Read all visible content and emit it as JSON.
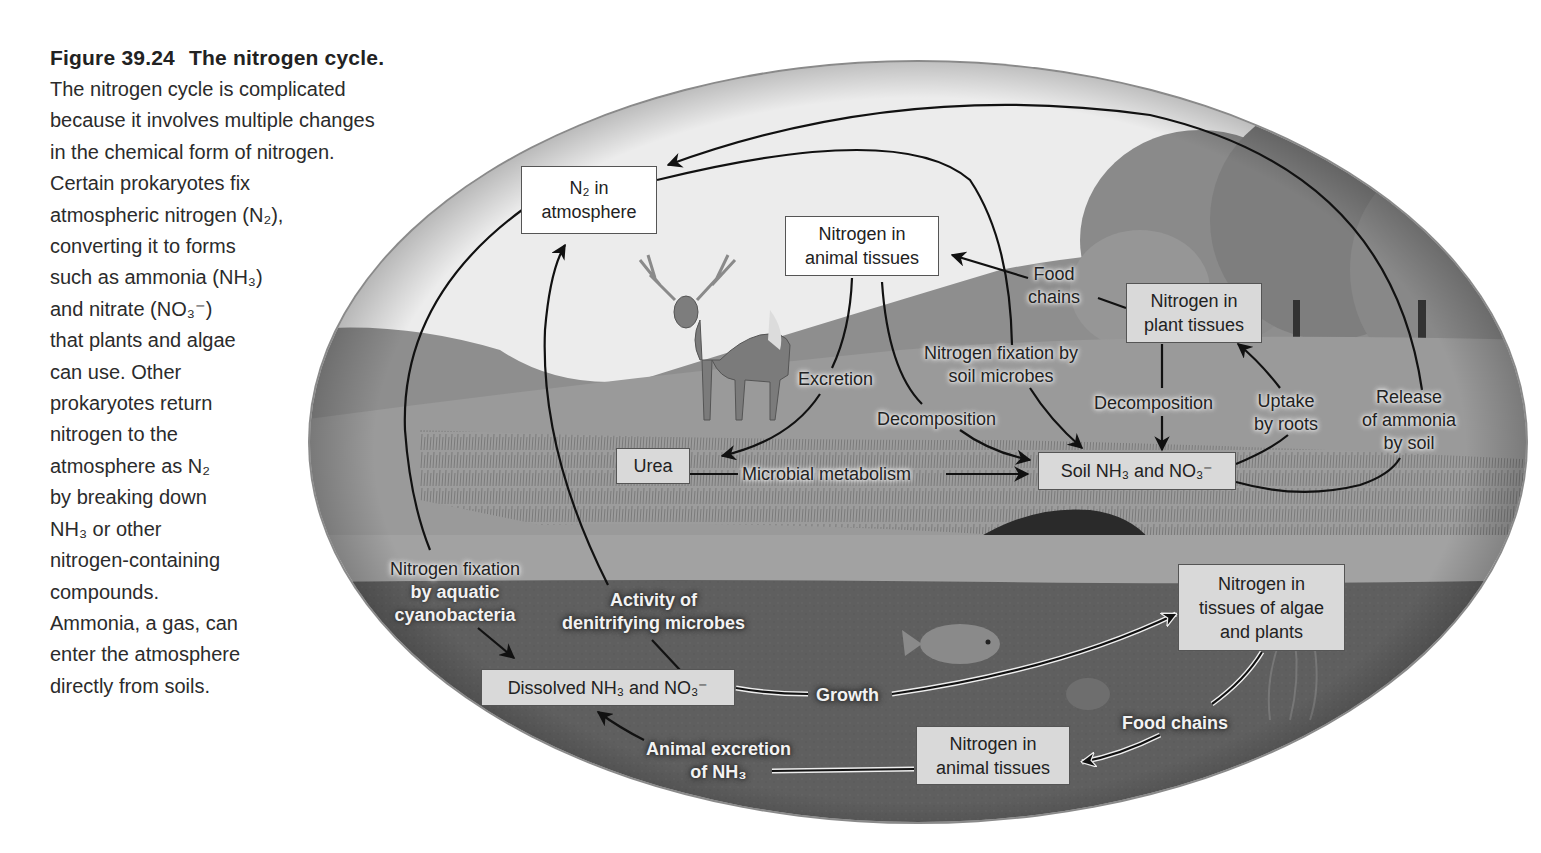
{
  "caption": {
    "figure_number": "Figure 39.24",
    "title": "The nitrogen cycle.",
    "lines": [
      "The nitrogen cycle is complicated",
      "because it involves multiple changes",
      "in the chemical form of nitrogen.",
      "Certain prokaryotes fix",
      "atmospheric nitrogen (N₂),",
      "converting it to forms",
      "such as ammonia (NH₃)",
      "and nitrate (NO₃⁻)",
      "that plants and algae",
      "can use. Other",
      "prokaryotes return",
      "nitrogen to the",
      "atmosphere as N₂",
      "by breaking down",
      "NH₃ or other",
      "nitrogen-containing",
      "compounds.",
      "Ammonia, a gas, can",
      "enter the atmosphere",
      "directly from soils."
    ]
  },
  "diagram": {
    "boxes": {
      "n2_atmosphere": {
        "line1": "N₂ in",
        "line2": "atmosphere"
      },
      "animal_tissues_land": {
        "line1": "Nitrogen in",
        "line2": "animal tissues"
      },
      "plant_tissues": {
        "line1": "Nitrogen in",
        "line2": "plant tissues"
      },
      "urea": {
        "line1": "Urea"
      },
      "soil_nh3_no3": {
        "line1": "Soil NH₃ and NO₃⁻"
      },
      "dissolved_nh3_no3": {
        "line1": "Dissolved NH₃ and NO₃⁻"
      },
      "algae_plants_tissues": {
        "line1": "Nitrogen in",
        "line2": "tissues of algae",
        "line3": "and plants"
      },
      "animal_tissues_water": {
        "line1": "Nitrogen in",
        "line2": "animal tissues"
      }
    },
    "process_labels": {
      "food_chains_land": {
        "line1": "Food",
        "line2": "chains"
      },
      "excretion": "Excretion",
      "nitrogen_fixation_soil": {
        "line1": "Nitrogen fixation by",
        "line2": "soil microbes"
      },
      "decomposition_animal": "Decomposition",
      "decomposition_plant": "Decomposition",
      "uptake_roots": {
        "line1": "Uptake",
        "line2": "by roots"
      },
      "release_ammonia": {
        "line1": "Release",
        "line2": "of ammonia",
        "line3": "by soil"
      },
      "microbial_metabolism": "Microbial metabolism",
      "nitrogen_fixation_aquatic": {
        "line1": "Nitrogen fixation",
        "line2": "by aquatic",
        "line3": "cyanobacteria"
      },
      "denitrifying": {
        "line1": "Activity of",
        "line2": "denitrifying microbes"
      },
      "growth": "Growth",
      "food_chains_water": "Food chains",
      "animal_excretion": {
        "line1": "Animal excretion",
        "line2": "of NH₃"
      }
    },
    "illustrations": [
      "deer",
      "trees",
      "grassland",
      "hills",
      "pond",
      "fish"
    ]
  },
  "colors": {
    "sky": "#ececec",
    "hills": "#8f8f8f",
    "grass": "#9a9a9a",
    "water": "#5e5e5e",
    "box_grey": "#d9d9d9",
    "box_white": "#ffffff",
    "arrow": "#111111"
  }
}
